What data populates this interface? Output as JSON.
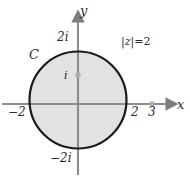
{
  "figure": {
    "type": "complex-plane-diagram",
    "colors": {
      "disk_fill": "#e2e2e2",
      "circle_stroke": "#1a1a1a",
      "axis": "#8c8c8c",
      "label_text": "#2b2b2b",
      "marker": "#9a9a9a",
      "background": "#ffffff"
    },
    "axes": {
      "x_label": "x",
      "y_label": "y",
      "origin": {
        "x": 78,
        "y": 104
      }
    },
    "circle": {
      "label": "C",
      "equation": "|z| = 2",
      "equation_parts": {
        "bar_left": "|",
        "variable": "z",
        "bar_right": "|",
        "relation": "=",
        "value": "2"
      },
      "radius_value": 2,
      "center": {
        "x": 78,
        "y": 100
      },
      "radius_px": 49
    },
    "ticks": {
      "x": [
        {
          "label": "−2",
          "value": -2
        },
        {
          "label": "2",
          "value": 2
        },
        {
          "label": "3",
          "value": 3
        }
      ],
      "y": [
        {
          "label": "2i",
          "value": 2
        },
        {
          "label": "i",
          "value": 1
        },
        {
          "label": "−2i",
          "value": -2
        }
      ]
    },
    "markers": [
      {
        "name": "point-i",
        "label": "i",
        "x": 78,
        "y": 75
      },
      {
        "name": "point-3",
        "label": "3",
        "x": 152,
        "y": 104
      }
    ]
  }
}
